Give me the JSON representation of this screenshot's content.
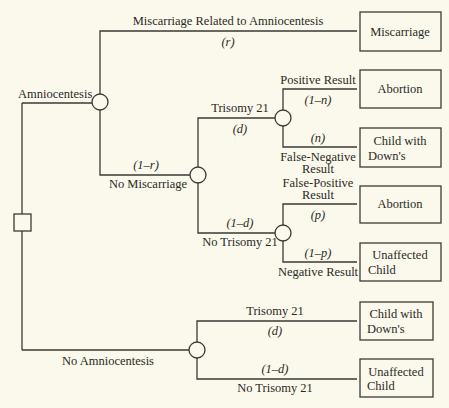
{
  "diagram": {
    "type": "decision-tree",
    "decision_node": "decision",
    "branches": {
      "amnio": {
        "label": "Amniocentesis",
        "miscarriage": {
          "label": "Miscarriage Related to Amniocentesis",
          "prob": "(r)",
          "outcome": "Miscarriage"
        },
        "no_miscarriage": {
          "label": "No Miscarriage",
          "prob": "(1–r)",
          "trisomy": {
            "label": "Trisomy 21",
            "prob": "(d)",
            "positive": {
              "label": "Positive Result",
              "prob": "(1–n)",
              "outcome": "Abortion"
            },
            "false_negative": {
              "label1": "False-Negative",
              "label2": "Result",
              "prob": "(n)",
              "outcome1": "Child with",
              "outcome2": "Down's"
            }
          },
          "no_trisomy": {
            "label": "No Trisomy 21",
            "prob": "(1–d)",
            "false_positive": {
              "label1": "False-Positive",
              "label2": "Result",
              "prob": "(p)",
              "outcome": "Abortion"
            },
            "negative": {
              "label": "Negative Result",
              "prob": "(1–p)",
              "outcome1": "Unaffected",
              "outcome2": "Child"
            }
          }
        }
      },
      "no_amnio": {
        "label": "No Amniocentesis",
        "trisomy": {
          "label": "Trisomy 21",
          "prob": "(d)",
          "outcome1": "Child with",
          "outcome2": "Down's"
        },
        "no_trisomy": {
          "label": "No Trisomy 21",
          "prob": "(1–d)",
          "outcome1": "Unaffected",
          "outcome2": "Child"
        }
      }
    }
  }
}
